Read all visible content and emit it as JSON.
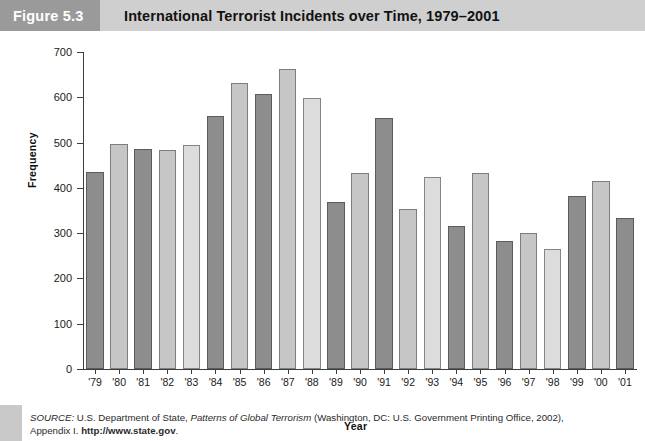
{
  "figure": {
    "label": "Figure 5.3",
    "title": "International Terrorist Incidents over Time, 1979–2001"
  },
  "source": {
    "prefix": "SOURCE:",
    "part1": " U.S. Department of State, ",
    "italic": "Patterns of Global Terrorism",
    "part2": " (Washington, DC: U.S. Government Printing Office, 2002),",
    "line2_pre": "Appendix I. ",
    "url": "http://www.state.gov",
    "line2_post": "."
  },
  "chart_data": {
    "type": "bar",
    "title": "International Terrorist Incidents over Time, 1979–2001",
    "xlabel": "Year",
    "ylabel": "Frequency",
    "ylim": [
      0,
      700
    ],
    "yticks": [
      0,
      100,
      200,
      300,
      400,
      500,
      600,
      700
    ],
    "grid": false,
    "legend": "none",
    "categories": [
      "'79",
      "'80",
      "'81",
      "'82",
      "'83",
      "'84",
      "'85",
      "'86",
      "'87",
      "'88",
      "'89",
      "'90",
      "'91",
      "'92",
      "'93",
      "'94",
      "'95",
      "'96",
      "'97",
      "'98",
      "'99",
      "'00",
      "'01"
    ],
    "values": [
      434,
      496,
      485,
      484,
      494,
      559,
      632,
      607,
      662,
      598,
      368,
      433,
      555,
      353,
      424,
      315,
      433,
      283,
      300,
      265,
      382,
      415,
      334
    ],
    "bar_shades": [
      "dark",
      "light",
      "dark",
      "light",
      "pale",
      "dark",
      "light",
      "dark",
      "light",
      "pale",
      "dark",
      "light",
      "dark",
      "light",
      "pale",
      "dark",
      "light",
      "dark",
      "light",
      "pale",
      "dark",
      "light",
      "dark"
    ],
    "colors": {
      "dark": "#8d8d8d",
      "light": "#c6c6c6",
      "pale": "#dcdcdc",
      "axis": "#3d3d3d",
      "header_label_bg": "#9a9a9a",
      "header_title_bg": "#cfcfcf",
      "gutter": "#c9c9c9"
    }
  }
}
